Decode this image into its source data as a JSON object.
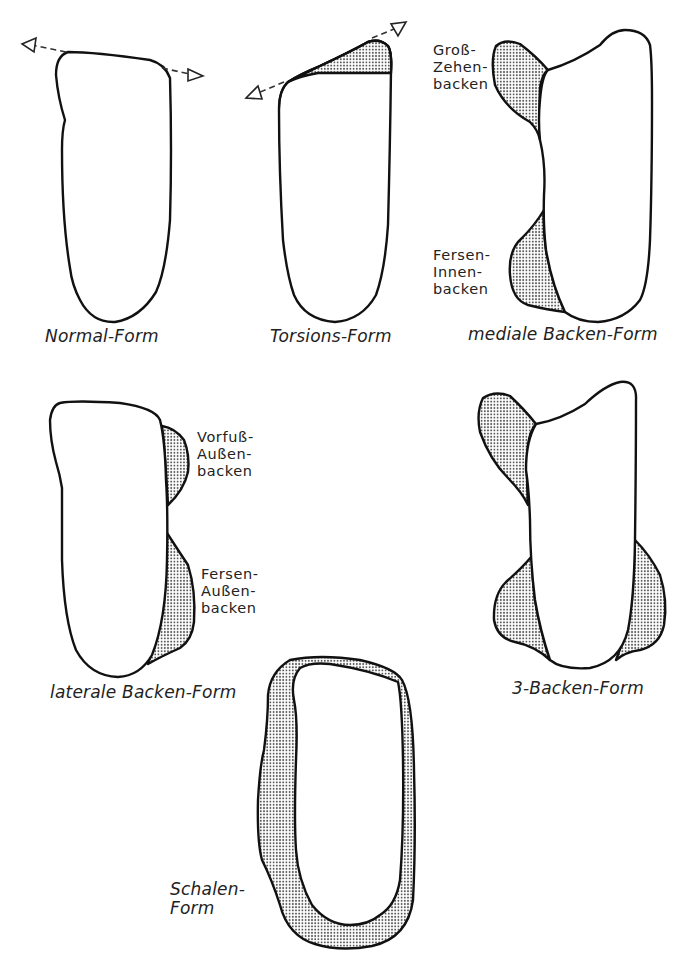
{
  "figure": {
    "type": "foot-sole outline diagram",
    "colors": {
      "line": "#111111",
      "stipple": "#555555",
      "background": "#ffffff"
    },
    "panels": [
      {
        "id": "normal",
        "caption": "Normal-Form",
        "annotations": [],
        "features": [
          "dashed-axis-arrows"
        ]
      },
      {
        "id": "torsion",
        "caption": "Torsions-Form",
        "annotations": [],
        "features": [
          "dashed-axis-arrows",
          "stippled-forefoot-wedge"
        ]
      },
      {
        "id": "medial",
        "caption": "mediale Backen-Form",
        "annotations": [
          {
            "line1": "Groß-",
            "line2": "Zehen-",
            "line3": "backen"
          },
          {
            "line1": "Fersen-",
            "line2": "Innen-",
            "line3": "backen"
          }
        ]
      },
      {
        "id": "lateral",
        "caption": "laterale Backen-Form",
        "annotations": [
          {
            "line1": "Vorfuß-",
            "line2": "Außen-",
            "line3": "backen"
          },
          {
            "line1": "Fersen-",
            "line2": "Außen-",
            "line3": "backen"
          }
        ]
      },
      {
        "id": "three",
        "caption": "3-Backen-Form",
        "annotations": []
      },
      {
        "id": "shell",
        "caption_line1": "Schalen-",
        "caption_line2": "Form",
        "annotations": []
      }
    ]
  }
}
